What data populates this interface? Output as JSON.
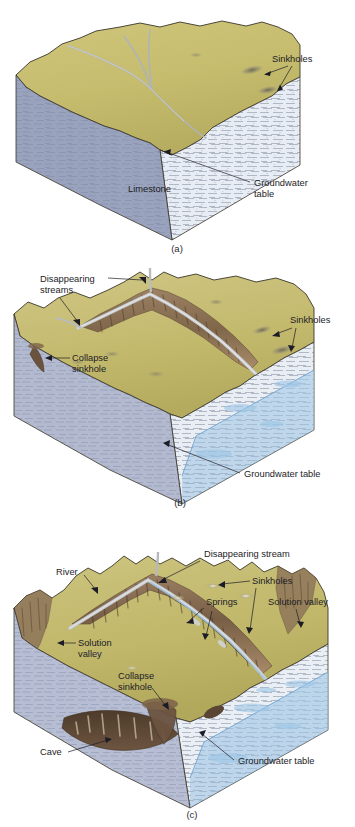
{
  "figure": {
    "domain": "diagram",
    "panel_count": 3
  },
  "colors": {
    "surface_top": "#c5bc6e",
    "surface_top_light": "#d2c984",
    "surface_shadow": "#a89f57",
    "limestone_front": "#e8ecf4",
    "limestone_side": "#9aa3bd",
    "limestone_side_light": "#b3bad0",
    "water_blue": "#a8cce8",
    "water_blue_deep": "#8ab8dd",
    "eroded_brown": "#8a6f55",
    "eroded_brown_dark": "#6b5340",
    "eroded_tan": "#b99a78",
    "cave_dark": "#5a4433",
    "stream_gray": "#b9bcbe",
    "outline": "#3a3528",
    "text": "#1c1c26"
  },
  "panels": [
    {
      "id": "a",
      "caption": "(a)",
      "stage_name": "early-karst-stage",
      "labels": [
        {
          "id": "sinkholes-a",
          "text": "Sinkholes",
          "leaders": 2
        },
        {
          "id": "limestone-a",
          "text": "Limestone",
          "leaders": 0
        },
        {
          "id": "groundwater-a-line1",
          "text": "Groundwater",
          "leaders": 1
        },
        {
          "id": "groundwater-a-line2",
          "text": "table",
          "leaders": 0
        }
      ]
    },
    {
      "id": "b",
      "caption": "(b)",
      "stage_name": "intermediate-karst-stage",
      "labels": [
        {
          "id": "disappearing-streams-b-line1",
          "text": "Disappearing",
          "leaders": 2
        },
        {
          "id": "disappearing-streams-b-line2",
          "text": "streams",
          "leaders": 0
        },
        {
          "id": "collapse-sinkhole-b-line1",
          "text": "Collapse",
          "leaders": 1
        },
        {
          "id": "collapse-sinkhole-b-line2",
          "text": "sinkhole",
          "leaders": 0
        },
        {
          "id": "sinkholes-b",
          "text": "Sinkholes",
          "leaders": 2
        },
        {
          "id": "groundwater-table-b",
          "text": "Groundwater table",
          "leaders": 1
        }
      ]
    },
    {
      "id": "c",
      "caption": "(c)",
      "stage_name": "late-karst-stage",
      "labels": [
        {
          "id": "disappearing-stream-c",
          "text": "Disappearing stream",
          "leaders": 1
        },
        {
          "id": "river-c",
          "text": "River",
          "leaders": 1
        },
        {
          "id": "sinkholes-c",
          "text": "Sinkholes",
          "leaders": 2
        },
        {
          "id": "springs-c",
          "text": "Springs",
          "leaders": 2
        },
        {
          "id": "solution-valley-c-right",
          "text": "Solution valley",
          "leaders": 1
        },
        {
          "id": "solution-valley-c-left-line1",
          "text": "Solution",
          "leaders": 1
        },
        {
          "id": "solution-valley-c-left-line2",
          "text": "valley",
          "leaders": 0
        },
        {
          "id": "collapse-sinkhole-c-line1",
          "text": "Collapse",
          "leaders": 1
        },
        {
          "id": "collapse-sinkhole-c-line2",
          "text": "sinkhole",
          "leaders": 0
        },
        {
          "id": "cave-c",
          "text": "Cave",
          "leaders": 1
        },
        {
          "id": "groundwater-table-c",
          "text": "Groundwater table",
          "leaders": 1
        }
      ]
    }
  ]
}
